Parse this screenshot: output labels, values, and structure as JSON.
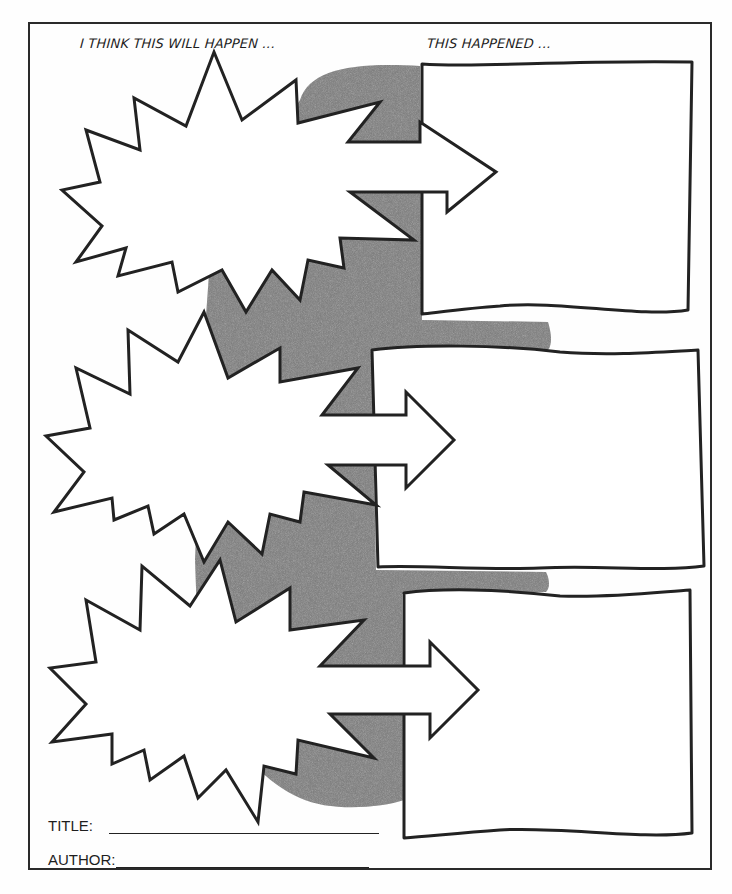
{
  "worksheet": {
    "type": "prediction graphic organizer",
    "headings": {
      "prediction": "I THINK THIS WILL HAPPEN ...",
      "outcome": "THIS HAPPENED ..."
    },
    "rows": [
      {
        "prediction_shape": "starburst",
        "connector": "arrow-right",
        "outcome_shape": "box",
        "prediction_text": "",
        "outcome_text": ""
      },
      {
        "prediction_shape": "starburst",
        "connector": "arrow-right",
        "outcome_shape": "box",
        "prediction_text": "",
        "outcome_text": ""
      },
      {
        "prediction_shape": "starburst",
        "connector": "arrow-right",
        "outcome_shape": "box",
        "prediction_text": "",
        "outcome_text": ""
      }
    ],
    "fields": {
      "title_label": "TITLE:",
      "title_value": "",
      "author_label": "AUTHOR:",
      "author_value": ""
    },
    "colors": {
      "ink": "#222222",
      "shadow": "#7a7a7a",
      "paper": "#fefefe"
    }
  }
}
